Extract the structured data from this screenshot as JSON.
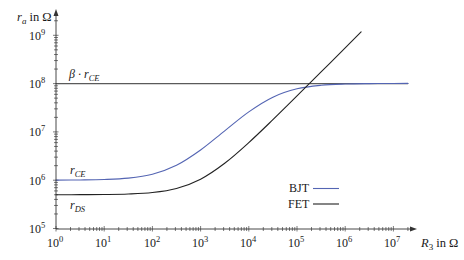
{
  "chart_data": {
    "type": "line",
    "title": "",
    "xlabel": "R_3 in Ω",
    "ylabel": "r_a in Ω",
    "xscale": "log",
    "yscale": "log",
    "xlim": [
      1,
      20000000
    ],
    "ylim": [
      100000,
      2400000000
    ],
    "grid": false,
    "legend_position": "lower right, inside plot",
    "xticks": [
      1,
      10,
      100,
      1000,
      10000,
      100000,
      1000000,
      10000000
    ],
    "xtick_labels": [
      "10^0",
      "10^1",
      "10^2",
      "10^3",
      "10^4",
      "10^5",
      "10^6",
      "10^7"
    ],
    "yticks": [
      100000,
      1000000,
      10000000,
      100000000,
      1000000000
    ],
    "ytick_labels": [
      "10^5",
      "10^6",
      "10^7",
      "10^8",
      "10^9"
    ],
    "series": [
      {
        "name": "BJT",
        "color": "#5465b3",
        "x": [
          1,
          3.16,
          10,
          31.6,
          100,
          316,
          1000,
          3162,
          10000,
          31623,
          100000,
          316228,
          1000000,
          3162278,
          10000000,
          20000000
        ],
        "y": [
          1003000,
          1011000,
          1033000,
          1105000,
          1332000,
          2040000,
          4230000,
          10530000,
          26000000,
          52300000,
          77900000,
          92300000,
          98100000,
          100060000,
          100700000,
          100850000
        ]
      },
      {
        "name": "FET",
        "color": "#222222",
        "x": [
          1,
          3.16,
          10,
          31.6,
          100,
          316,
          1000,
          3162,
          10000,
          31623,
          100000,
          316228,
          1000000,
          2137962
        ],
        "y": [
          500600,
          501700,
          505500,
          517400,
          555000,
          674000,
          1050000,
          2240000,
          6000000,
          17900000,
          55500000,
          174400000,
          550500000,
          1176000000
        ]
      },
      {
        "name": "β · r_CE (asymptote)",
        "color": "#5a5a5a",
        "x": [
          1,
          20000000
        ],
        "y": [
          100000000,
          100000000
        ]
      }
    ],
    "annotations": [
      {
        "text": "β · r_CE",
        "x": 1.6,
        "y": 100000000,
        "position": "above line"
      },
      {
        "text": "r_CE",
        "x": 1.6,
        "y": 1000000,
        "position": "above BJT curve"
      },
      {
        "text": "r_DS",
        "x": 1.6,
        "y": 500000,
        "position": "below FET curve"
      }
    ]
  },
  "axes": {
    "y_label": {
      "var": "r",
      "sub": "a",
      "unit": " in Ω"
    },
    "x_label": {
      "var": "R",
      "sub": "3",
      "unit": " in Ω"
    },
    "x_ticks": [
      {
        "base": "10",
        "exp": "0"
      },
      {
        "base": "10",
        "exp": "1"
      },
      {
        "base": "10",
        "exp": "2"
      },
      {
        "base": "10",
        "exp": "3"
      },
      {
        "base": "10",
        "exp": "4"
      },
      {
        "base": "10",
        "exp": "5"
      },
      {
        "base": "10",
        "exp": "6"
      },
      {
        "base": "10",
        "exp": "7"
      }
    ],
    "y_ticks": [
      {
        "base": "10",
        "exp": "5"
      },
      {
        "base": "10",
        "exp": "6"
      },
      {
        "base": "10",
        "exp": "7"
      },
      {
        "base": "10",
        "exp": "8"
      },
      {
        "base": "10",
        "exp": "9"
      }
    ]
  },
  "annotations": {
    "beta_rce": {
      "prefix": "β · ",
      "var": "r",
      "sub": "CE"
    },
    "rce": {
      "var": "r",
      "sub": "CE"
    },
    "rds": {
      "var": "r",
      "sub": "DS"
    }
  },
  "legend": {
    "items": [
      {
        "label": "BJT",
        "color": "#5465b3"
      },
      {
        "label": "FET",
        "color": "#222222"
      }
    ]
  }
}
